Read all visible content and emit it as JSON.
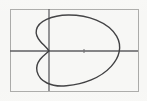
{
  "figure": {
    "title": "",
    "background_color": "#f7f7f5",
    "frame": {
      "stroke_color": "#a8a8a6",
      "stroke_width": 1,
      "left": 10,
      "top": 9,
      "right": 138,
      "bottom": 91
    },
    "axes": {
      "stroke_color": "#5a5a5c",
      "stroke_width": 1.3,
      "x_axis_y": 51,
      "y_axis_x": 49,
      "x_axis_label": "",
      "y_axis_label": "",
      "tick_marks": [
        {
          "name": "x-axis-tick",
          "x": 84,
          "y": 51,
          "length": 4
        }
      ]
    },
    "curve": {
      "name": "limacon-with-dimple",
      "stroke_color": "#3c3c3e",
      "stroke_width": 1.4,
      "fill": "none",
      "description": "Closed limacon curve opening to the right with a concave dimple meeting the vertical axis near the origin",
      "extents": {
        "left_lobe_x": 36,
        "right_x": 119,
        "top_y": 15,
        "bottom_y": 86,
        "dimple_x": 49,
        "dimple_y": 51
      },
      "path": "M 49 51 C 46.5 47.2 43.0 44.6 40.2 41.2 C 37.2 37.6 35.6 33.6 36.4 29.8 C 37.4 25.1 41.6 21.6 46.6 19.3 C 53.0 16.4 60.6 15.1 68.2 15.0 C 78.0 14.9 87.8 16.6 96.4 20.1 C 105.2 23.7 112.6 29.2 116.6 36.2 C 119.4 41.1 120.2 46.6 119.2 51.7 C 118.2 57.0 115.2 62.0 111.2 66.4 C 106.0 72.1 99.0 76.7 91.2 79.9 C 83.4 83.1 74.8 84.9 66.4 85.8 C 59.6 86.5 52.6 85.8 47.0 83.0 C 42.0 80.5 38.2 76.3 37.0 71.3 C 36.0 67.1 37.4 62.8 40.2 59.2 C 43.0 55.6 46.5 53.4 49 51 Z"
    }
  },
  "chart_data": {
    "type": "line",
    "title": "",
    "subtitle": "",
    "xlabel": "",
    "ylabel": "",
    "grid": false,
    "legend": null,
    "legend_position": "none",
    "coordinate_system": "polar-rendered-on-cartesian",
    "equation_form": "r = a + b*cos(theta)  (limacon with dimple)",
    "axis_ranges": {
      "xlim": [
        -0.55,
        1.25
      ],
      "ylim": [
        -0.62,
        0.62
      ]
    },
    "series": [
      {
        "name": "limacon",
        "closed": true,
        "points_px": [
          [
            49,
            51
          ],
          [
            43,
            44.6
          ],
          [
            37.6,
            37.2
          ],
          [
            36.4,
            29.8
          ],
          [
            41.6,
            21.6
          ],
          [
            52.0,
            16.7
          ],
          [
            68.2,
            15.0
          ],
          [
            84.0,
            16.9
          ],
          [
            100.5,
            22.0
          ],
          [
            113.0,
            31.5
          ],
          [
            119.2,
            43.0
          ],
          [
            119.2,
            51.7
          ],
          [
            116.0,
            61.0
          ],
          [
            108.0,
            70.5
          ],
          [
            95.0,
            78.5
          ],
          [
            79.0,
            84.0
          ],
          [
            66.4,
            85.8
          ],
          [
            53.0,
            84.4
          ],
          [
            41.5,
            78.0
          ],
          [
            37.0,
            68.5
          ],
          [
            40.2,
            59.2
          ],
          [
            46.0,
            54.0
          ],
          [
            49,
            51
          ]
        ],
        "annotations": []
      }
    ],
    "key_features": [
      {
        "label": "rightmost point",
        "px": [
          119,
          51
        ]
      },
      {
        "label": "topmost point",
        "px": [
          70,
          15
        ]
      },
      {
        "label": "bottommost point",
        "px": [
          70,
          86
        ]
      },
      {
        "label": "dimple / cusp at vertical axis",
        "px": [
          49,
          51
        ]
      },
      {
        "label": "leftmost extent of lobes",
        "px": [
          36,
          30
        ]
      }
    ]
  }
}
